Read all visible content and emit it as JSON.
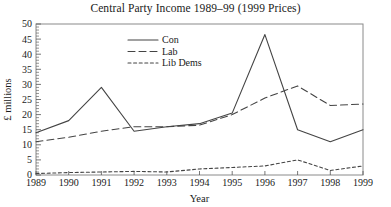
{
  "chart_data": {
    "type": "line",
    "title": "Central Party Income 1989–99 (1999 Prices)",
    "xlabel": "Year",
    "ylabel": "£ millions",
    "x": [
      1989,
      1990,
      1991,
      1992,
      1993,
      1994,
      1995,
      1996,
      1997,
      1998,
      1999
    ],
    "xticklabels": [
      "1989",
      "1990",
      "1991",
      "1992",
      "1993",
      "1994",
      "1995",
      "1996",
      "1997",
      "1998",
      "1999"
    ],
    "yticklabels": [
      "0",
      "5",
      "10",
      "15",
      "20",
      "25",
      "30",
      "35",
      "40",
      "45",
      "50"
    ],
    "yticks": [
      0,
      5,
      10,
      15,
      20,
      25,
      30,
      35,
      40,
      45,
      50
    ],
    "ylim": [
      0,
      50
    ],
    "xlim": [
      1989,
      1999
    ],
    "grid": false,
    "legend_position": "top-center",
    "series": [
      {
        "name": "Con",
        "style": "solid",
        "color": "#444444",
        "values": [
          14.0,
          18.0,
          29.0,
          14.5,
          16.0,
          17.0,
          20.5,
          46.5,
          15.0,
          11.0,
          15.0
        ]
      },
      {
        "name": "Lab",
        "style": "dashed",
        "color": "#444444",
        "values": [
          11.0,
          12.5,
          14.5,
          16.0,
          16.0,
          16.5,
          20.0,
          25.5,
          29.5,
          23.0,
          23.5
        ]
      },
      {
        "name": "Lib Dems",
        "style": "dotted",
        "color": "#444444",
        "values": [
          0.5,
          0.8,
          1.0,
          1.2,
          1.0,
          2.0,
          2.5,
          3.0,
          5.0,
          1.5,
          3.0
        ]
      }
    ]
  }
}
